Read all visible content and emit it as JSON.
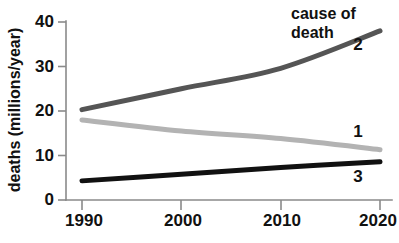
{
  "chart_data": {
    "type": "line",
    "title": "",
    "legend_title": "cause of death",
    "legend_title_line1": "cause of",
    "legend_title_line2": "death",
    "legend_position": "top-right-inline",
    "xlabel": "",
    "ylabel": "deaths (millions/year)",
    "x": [
      1990,
      2000,
      2010,
      2020
    ],
    "xtick_labels": [
      "1990",
      "2000",
      "2010",
      "2020"
    ],
    "ytick_labels": [
      "0",
      "10",
      "20",
      "30",
      "40"
    ],
    "ytick_values": [
      0,
      10,
      20,
      30,
      40
    ],
    "xlim": [
      1990,
      2020
    ],
    "ylim": [
      0,
      40
    ],
    "grid": false,
    "series": [
      {
        "name": "1",
        "label": "1",
        "color": "#b3b3b3",
        "values": [
          18.0,
          15.5,
          13.8,
          11.3
        ]
      },
      {
        "name": "2",
        "label": "2",
        "color": "#555555",
        "values": [
          20.3,
          25.0,
          29.6,
          38.0
        ]
      },
      {
        "name": "3",
        "label": "3",
        "color": "#111111",
        "values": [
          4.3,
          5.8,
          7.3,
          8.6
        ]
      }
    ]
  },
  "axes": {
    "axis_color": "#8a8a8a",
    "y_axis_title": "deaths (millions/year)"
  }
}
